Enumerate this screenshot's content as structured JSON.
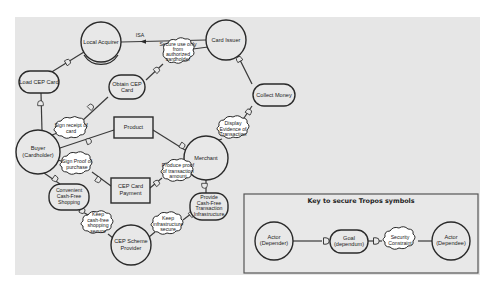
{
  "diagram": {
    "actors": {
      "local_acquirer": "Local Acquirer",
      "card_issuer": "Card Issuer",
      "buyer_line1": "Buyer",
      "buyer_line2": "(Cardholder)",
      "merchant": "Merchant",
      "cep_provider_line1": "CEP Scheme",
      "cep_provider_line2": "Provider"
    },
    "goals": {
      "load_cep_card": "Load CEP Card",
      "obtain_cep_card_line1": "Obtain CEP",
      "obtain_cep_card_line2": "Card",
      "collect_money": "Collect Money",
      "convenient_line1": "Convenient",
      "convenient_line2": "Cash-Free",
      "convenient_line3": "Shopping",
      "provide_line1": "Provide",
      "provide_line2": "Cash-Free",
      "provide_line3": "Transaction",
      "provide_line4": "Infrastructure"
    },
    "resources": {
      "product": "Product",
      "cep_payment_line1": "CEP Card",
      "cep_payment_line2": "Payment"
    },
    "security_constraints": {
      "secure_use_line1": "Secure use only",
      "secure_use_line2": "from",
      "secure_use_line3": "authorized",
      "secure_use_line4": "cardholder",
      "sign_receipt_line1": "Sign receipt of",
      "sign_receipt_line2": "card",
      "display_evidence_line1": "Display",
      "display_evidence_line2": "Evidence of",
      "display_evidence_line3": "Transaction",
      "sign_proof_line1": "Sign Proof of",
      "sign_proof_line2": "purchase",
      "produce_proof_line1": "Produce proof",
      "produce_proof_line2": "of transaction",
      "produce_proof_line3": "amount",
      "keep_shopping_line1": "Keep",
      "keep_shopping_line2": "cash-free",
      "keep_shopping_line3": "shopping",
      "keep_shopping_line4": "secure",
      "keep_infra_line1": "Keep",
      "keep_infra_line2": "infrastructure",
      "keep_infra_line3": "secure"
    },
    "isa_label": "ISA"
  },
  "key": {
    "title": "Key to secure Tropos symbols",
    "depender_line1": "Actor",
    "depender_line2": "(Depender)",
    "goal_line1": "Goal",
    "goal_line2": "(dependum)",
    "constraint_line1": "Security",
    "constraint_line2": "Constraint",
    "dependee_line1": "Actor",
    "dependee_line2": "(Dependee)"
  },
  "colors": {
    "canvas": "#e6e6e6",
    "stroke": "#2a2a2a",
    "cloud_fill": "#ffffff"
  }
}
